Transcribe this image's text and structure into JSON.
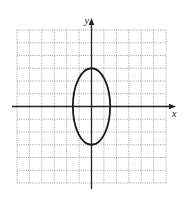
{
  "chart_data": {
    "type": "line",
    "title": "",
    "xlabel": "x",
    "ylabel": "y",
    "xlim": [
      -6,
      6
    ],
    "ylim": [
      -6,
      6
    ],
    "grid": true,
    "grid_style": "dotted",
    "tick_labels": false,
    "series": [
      {
        "name": "ellipse",
        "shape": "ellipse",
        "center": [
          0,
          0
        ],
        "semi_axis_x": 1.5,
        "semi_axis_y": 3,
        "equation": "x^2/2.25 + y^2/9 = 1",
        "color": "#1a1a1a"
      }
    ]
  },
  "colors": {
    "grid": "#8a8a8a",
    "axes": "#222222",
    "curve": "#1a1a1a"
  }
}
